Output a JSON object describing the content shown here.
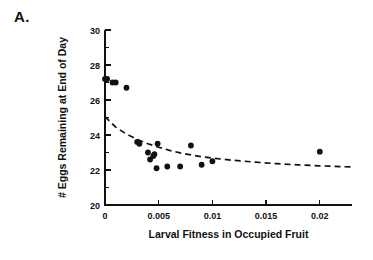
{
  "figure": {
    "panel_label": "A."
  },
  "chart_data": {
    "type": "scatter",
    "title": "",
    "panel": "A.",
    "xlabel": "Larval Fitness in Occupied Fruit",
    "ylabel": "# Eggs Remaining at End of Day",
    "xlim": [
      0,
      0.023
    ],
    "ylim": [
      20,
      30
    ],
    "xticks": [
      0,
      0.005,
      0.01,
      0.015,
      0.02
    ],
    "xtick_labels": [
      "0",
      "0.005",
      "0.01",
      "0.015",
      "0.02"
    ],
    "yticks": [
      20,
      22,
      24,
      26,
      28,
      30
    ],
    "ytick_labels": [
      "20",
      "22",
      "24",
      "26",
      "28",
      "30"
    ],
    "y_minor_ticks": [
      21,
      23,
      25,
      27,
      29
    ],
    "grid": false,
    "legend": null,
    "marker": "filled-circle",
    "marker_color": "#111111",
    "points": [
      {
        "x": 0.0,
        "y": 27.2
      },
      {
        "x": 0.0002,
        "y": 27.2
      },
      {
        "x": 0.0007,
        "y": 27.0
      },
      {
        "x": 0.001,
        "y": 27.0
      },
      {
        "x": 0.002,
        "y": 26.7
      },
      {
        "x": 0.003,
        "y": 23.6
      },
      {
        "x": 0.0032,
        "y": 23.5
      },
      {
        "x": 0.004,
        "y": 23.0
      },
      {
        "x": 0.0042,
        "y": 22.6
      },
      {
        "x": 0.0045,
        "y": 22.8
      },
      {
        "x": 0.0046,
        "y": 22.9
      },
      {
        "x": 0.0048,
        "y": 22.1
      },
      {
        "x": 0.0049,
        "y": 23.5
      },
      {
        "x": 0.0058,
        "y": 22.2
      },
      {
        "x": 0.007,
        "y": 22.2
      },
      {
        "x": 0.008,
        "y": 23.4
      },
      {
        "x": 0.009,
        "y": 22.3
      },
      {
        "x": 0.01,
        "y": 22.5
      },
      {
        "x": 0.02,
        "y": 23.05
      }
    ],
    "fit_curve": {
      "style": "dashed",
      "color": "#111111",
      "description": "decaying power/exponential fit through the scatter",
      "points": [
        {
          "x": 0.0,
          "y": 25.05
        },
        {
          "x": 0.001,
          "y": 24.45
        },
        {
          "x": 0.002,
          "y": 24.05
        },
        {
          "x": 0.003,
          "y": 23.75
        },
        {
          "x": 0.004,
          "y": 23.5
        },
        {
          "x": 0.005,
          "y": 23.3
        },
        {
          "x": 0.006,
          "y": 23.12
        },
        {
          "x": 0.007,
          "y": 22.98
        },
        {
          "x": 0.008,
          "y": 22.86
        },
        {
          "x": 0.009,
          "y": 22.76
        },
        {
          "x": 0.01,
          "y": 22.68
        },
        {
          "x": 0.012,
          "y": 22.55
        },
        {
          "x": 0.014,
          "y": 22.45
        },
        {
          "x": 0.016,
          "y": 22.36
        },
        {
          "x": 0.018,
          "y": 22.29
        },
        {
          "x": 0.02,
          "y": 22.24
        },
        {
          "x": 0.023,
          "y": 22.17
        }
      ]
    }
  }
}
